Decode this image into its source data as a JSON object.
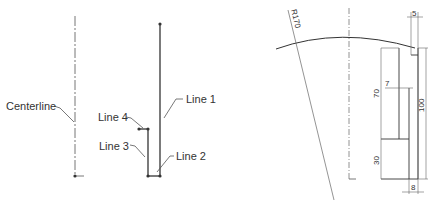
{
  "left_sketch": {
    "labels": {
      "centerline": "Centerline",
      "line1": "Line 1",
      "line2": "Line 2",
      "line3": "Line  3",
      "line4": "Line 4"
    }
  },
  "right_sketch": {
    "radius_label": "R170",
    "dimensions": {
      "top_width": "5",
      "step_width": "7",
      "bottom_width": "8",
      "upper_height": "70",
      "lower_height": "30",
      "total_height": "100"
    }
  },
  "colors": {
    "line": "#333333",
    "leader": "#555555",
    "centerline": "#777777"
  }
}
